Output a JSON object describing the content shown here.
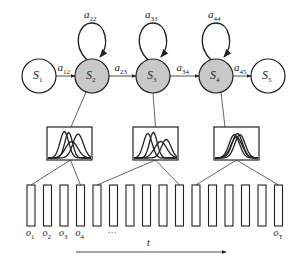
{
  "diagram": {
    "type": "hmm-gaussian-emission",
    "colors": {
      "stroke": "#222222",
      "emitting_state_fill": "#c8c8c8",
      "non_emitting_state_fill": "#ffffff",
      "background": "#ffffff"
    },
    "states": [
      {
        "id": "S1",
        "base": "S",
        "sub": "1",
        "emitting": false,
        "cx": 39,
        "cy": 76
      },
      {
        "id": "S2",
        "base": "S",
        "sub": "2",
        "emitting": true,
        "cx": 92,
        "cy": 76
      },
      {
        "id": "S3",
        "base": "S",
        "sub": "3",
        "emitting": true,
        "cx": 153,
        "cy": 76
      },
      {
        "id": "S4",
        "base": "S",
        "sub": "4",
        "emitting": true,
        "cx": 216,
        "cy": 76
      },
      {
        "id": "S5",
        "base": "S",
        "sub": "5",
        "emitting": false,
        "cx": 268,
        "cy": 76
      }
    ],
    "transitions": [
      {
        "from": "S1",
        "to": "S2",
        "base": "a",
        "sub": "12"
      },
      {
        "from": "S2",
        "to": "S3",
        "base": "a",
        "sub": "23"
      },
      {
        "from": "S3",
        "to": "S4",
        "base": "a",
        "sub": "34"
      },
      {
        "from": "S4",
        "to": "S5",
        "base": "a",
        "sub": "45"
      }
    ],
    "self_loops": [
      {
        "state": "S2",
        "base": "a",
        "sub": "22"
      },
      {
        "state": "S3",
        "base": "a",
        "sub": "33"
      },
      {
        "state": "S4",
        "base": "a",
        "sub": "44"
      }
    ],
    "emission_boxes": [
      {
        "state": "S2",
        "x": 47,
        "y": 127,
        "w": 45,
        "h": 33,
        "description": "mixture of Gaussians (3 components)"
      },
      {
        "state": "S3",
        "x": 133,
        "y": 127,
        "w": 45,
        "h": 33,
        "description": "mixture of Gaussians (3 components)"
      },
      {
        "state": "S4",
        "x": 214,
        "y": 127,
        "w": 45,
        "h": 33,
        "description": "mixture of Gaussians (3 components, overlapping)"
      }
    ],
    "observations": {
      "count": 16,
      "labels": [
        {
          "index": 0,
          "base": "o",
          "sub": "1"
        },
        {
          "index": 1,
          "base": "o",
          "sub": "2"
        },
        {
          "index": 2,
          "base": "o",
          "sub": "3"
        },
        {
          "index": 3,
          "base": "o",
          "sub": "4"
        },
        {
          "index": 15,
          "base": "o",
          "sub": "T"
        }
      ],
      "ellipsis": "…"
    },
    "box_to_observation_links": [
      {
        "box": 0,
        "obs_start": 0,
        "obs_end": 3
      },
      {
        "box": 1,
        "obs_start": 4,
        "obs_end": 9
      },
      {
        "box": 2,
        "obs_start": 10,
        "obs_end": 15
      }
    ],
    "time_axis": {
      "label": "t",
      "direction": "right"
    }
  }
}
